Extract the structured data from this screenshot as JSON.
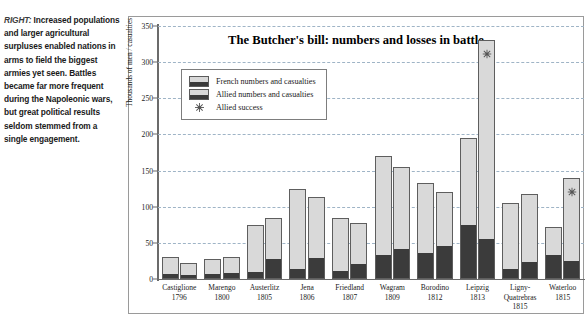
{
  "caption": {
    "lead": "RIGHT:",
    "text": " Increased populations and larger agricultural surpluses enabled nations in arms to field the biggest armies yet seen. Battles became far more frequent during the Napoleonic wars, but great political results seldom stemmed from a single engagement."
  },
  "legend": {
    "items": [
      {
        "label": "French numbers and casualties",
        "icon": "bar-swatch-icon"
      },
      {
        "label": "Allied numbers and casualties",
        "icon": "bar-swatch-icon"
      },
      {
        "label": "Allied success",
        "icon": "star-icon"
      }
    ]
  },
  "colors": {
    "numbers_fill": "#d9d9d9",
    "casualties_fill": "#3b3b3b",
    "bar_outline": "#5e5e5e",
    "gridline": "#9fb4c6",
    "axis": "#6b6b6b",
    "star": "#555555"
  },
  "chart_data": {
    "type": "bar",
    "title": "The Butcher's bill:  numbers and losses in battle",
    "xlabel": "",
    "ylabel": "Thousands of men / casualties",
    "ylim": [
      0,
      350
    ],
    "yticks": [
      0,
      50,
      100,
      150,
      200,
      250,
      300,
      350
    ],
    "grid": true,
    "legend_position": "upper-left-inside",
    "categories": [
      "Castiglione",
      "Marengo",
      "Austerlitz",
      "Jena",
      "Friedland",
      "Wagram",
      "Borodino",
      "Leipzig",
      "Ligny-Quatrebras",
      "Waterloo"
    ],
    "years": [
      "1796",
      "1800",
      "1805",
      "1806",
      "1807",
      "1809",
      "1812",
      "1813",
      "1815",
      "1815"
    ],
    "series": [
      {
        "name": "French numbers",
        "values": [
          30,
          28,
          75,
          125,
          85,
          170,
          133,
          195,
          105,
          72
        ]
      },
      {
        "name": "French casualties",
        "values": [
          5,
          6,
          9,
          12,
          10,
          32,
          35,
          73,
          12,
          32
        ]
      },
      {
        "name": "Allied numbers",
        "values": [
          22,
          31,
          85,
          113,
          78,
          155,
          120,
          330,
          118,
          140
        ]
      },
      {
        "name": "Allied casualties",
        "values": [
          4,
          7,
          26,
          27,
          20,
          40,
          44,
          54,
          22,
          24
        ]
      }
    ],
    "annotations": [
      {
        "type": "star",
        "label": "Allied success",
        "category": "Leipzig",
        "value": 330
      },
      {
        "type": "star",
        "label": "Allied success",
        "category": "Waterloo",
        "value": 140
      }
    ]
  }
}
